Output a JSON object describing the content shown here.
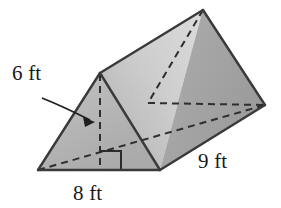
{
  "figure": {
    "name": "triangular-prism-diagram",
    "shape_type": "triangular prism",
    "background_color": "#ffffff",
    "outline_color": "#3a3a3a",
    "dashed_color": "#2e2e2e",
    "face_shading": {
      "front_triangle": "#b5b5b5",
      "top_slope_left": "#c9c9c9",
      "top_slope_right": "#a9a9a9",
      "right_face": "#a3a3a3"
    },
    "labels": {
      "height": {
        "text": "6 ft",
        "value": 6,
        "unit": "ft",
        "describes": "vertical height of triangular base",
        "x": 12,
        "y": 80
      },
      "base": {
        "text": "8 ft",
        "value": 8,
        "unit": "ft",
        "describes": "base width of triangular face",
        "x": 73,
        "y": 200
      },
      "length": {
        "text": "9 ft",
        "value": 9,
        "unit": "ft",
        "describes": "length of prism",
        "x": 198,
        "y": 168
      }
    },
    "markers": {
      "right_angle": "right-angle-square",
      "leader": "arrow-from-6ft-label-to-height-line"
    },
    "vertices": {
      "front_bottom_left": [
        38,
        170
      ],
      "front_bottom_right": [
        160,
        170
      ],
      "front_apex": [
        100,
        73
      ],
      "back_apex": [
        203,
        10
      ],
      "back_bottom_right": [
        265,
        105
      ],
      "back_bottom_left_hidden": [
        148,
        103
      ],
      "height_foot": [
        100,
        170
      ]
    }
  }
}
